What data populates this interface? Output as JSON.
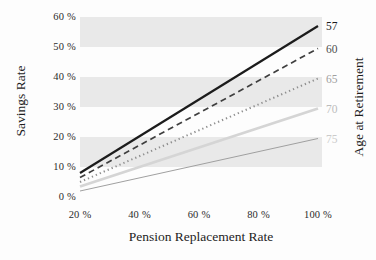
{
  "chart_data": {
    "type": "line",
    "title": "",
    "xlabel": "Pension Replacement Rate",
    "ylabel_left": "Savings Rate",
    "ylabel_right": "Age at Retirement",
    "xlim": [
      20,
      100
    ],
    "ylim": [
      0,
      60
    ],
    "grid": false,
    "legend_position": "right-edge-line-labels",
    "x_ticks": [
      {
        "value": 20,
        "label": "20 %"
      },
      {
        "value": 40,
        "label": "40 %"
      },
      {
        "value": 60,
        "label": "60 %"
      },
      {
        "value": 80,
        "label": "80 %"
      },
      {
        "value": 100,
        "label": "100 %"
      }
    ],
    "y_ticks": [
      {
        "value": 0,
        "label": "0 %"
      },
      {
        "value": 10,
        "label": "10 %"
      },
      {
        "value": 20,
        "label": "20 %"
      },
      {
        "value": 30,
        "label": "30 %"
      },
      {
        "value": 40,
        "label": "40 %"
      },
      {
        "value": 50,
        "label": "50 %"
      },
      {
        "value": 60,
        "label": "60 %"
      }
    ],
    "background_bands": {
      "color": "#e9e9e9",
      "ranges": [
        [
          10,
          20
        ],
        [
          30,
          40
        ],
        [
          50,
          60
        ]
      ]
    },
    "series": [
      {
        "label": "57",
        "x": [
          20,
          100
        ],
        "values": [
          8.0,
          57.0
        ],
        "style": "solid",
        "color": "#1c1c1c",
        "width": 2.2,
        "label_color": "#1c1c1c"
      },
      {
        "label": "60",
        "x": [
          20,
          100
        ],
        "values": [
          6.5,
          49.5
        ],
        "style": "dashed",
        "color": "#3f3f3f",
        "width": 1.7,
        "label_color": "#4f4f4f"
      },
      {
        "label": "65",
        "x": [
          20,
          100
        ],
        "values": [
          5.0,
          39.5
        ],
        "style": "dotted",
        "color": "#8f8f8f",
        "width": 2.0,
        "label_color": "#9f9f9f"
      },
      {
        "label": "70",
        "x": [
          20,
          100
        ],
        "values": [
          3.5,
          29.5
        ],
        "style": "solid",
        "color": "#d5d5d5",
        "width": 2.8,
        "label_color": "#bcbcbc"
      },
      {
        "label": "75",
        "x": [
          20,
          100
        ],
        "values": [
          2.0,
          19.5
        ],
        "style": "solid",
        "color": "#a0a0a0",
        "width": 1.0,
        "label_color": "#cbcbcb"
      }
    ]
  }
}
